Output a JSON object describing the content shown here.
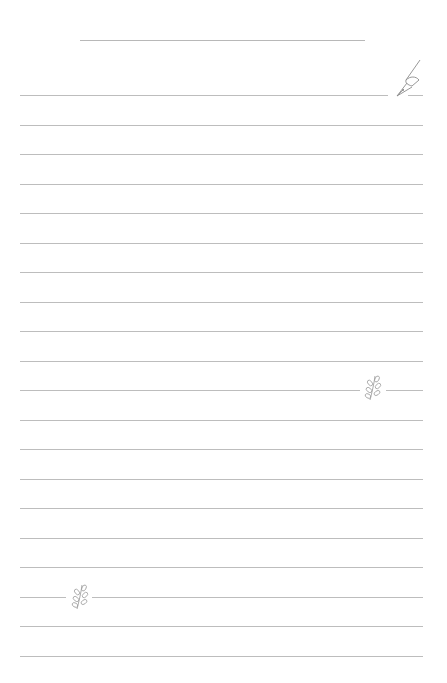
{
  "page": {
    "type": "lined-notepaper",
    "background": "#ffffff",
    "line_color": "#bdbdbd",
    "title_line": {
      "visible": true
    },
    "line_count": 20,
    "line_start_y": 95,
    "line_spacing": 29.5
  },
  "icons": [
    {
      "name": "fountain-pen-icon",
      "line_index": 0
    },
    {
      "name": "leaf-sprig-icon",
      "line_index": 10
    },
    {
      "name": "leaf-sprig-icon",
      "line_index": 17
    }
  ]
}
